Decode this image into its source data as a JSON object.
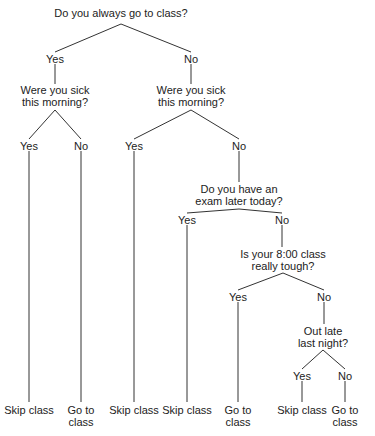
{
  "diagram": {
    "type": "decision-tree",
    "title": "Do you always go to class?",
    "nodes": [
      {
        "id": "q1",
        "text": "Do you always go to class?",
        "x": 121,
        "y": 7
      },
      {
        "id": "a1",
        "text": "Yes",
        "x": 55,
        "y": 53
      },
      {
        "id": "a2",
        "text": "No",
        "x": 191,
        "y": 53
      },
      {
        "id": "q2",
        "text": "Were you sick\nthis morning?",
        "x": 55,
        "y": 84
      },
      {
        "id": "q3",
        "text": "Were you sick\nthis morning?",
        "x": 191,
        "y": 84
      },
      {
        "id": "a3",
        "text": "Yes",
        "x": 29,
        "y": 140
      },
      {
        "id": "a4",
        "text": "No",
        "x": 81,
        "y": 140
      },
      {
        "id": "a5",
        "text": "Yes",
        "x": 134,
        "y": 140
      },
      {
        "id": "a6",
        "text": "No",
        "x": 239,
        "y": 140
      },
      {
        "id": "q4",
        "text": "Do you have an\nexam later today?",
        "x": 239,
        "y": 183
      },
      {
        "id": "a7",
        "text": "Yes",
        "x": 187,
        "y": 214
      },
      {
        "id": "a8",
        "text": "No",
        "x": 282,
        "y": 214
      },
      {
        "id": "q5",
        "text": "Is your 8:00 class\nreally tough?",
        "x": 283,
        "y": 248
      },
      {
        "id": "a9",
        "text": "Yes",
        "x": 238,
        "y": 291
      },
      {
        "id": "a10",
        "text": "No",
        "x": 324,
        "y": 291
      },
      {
        "id": "q6",
        "text": "Out late\nlast night?",
        "x": 323,
        "y": 325
      },
      {
        "id": "a11",
        "text": "Yes",
        "x": 302,
        "y": 370
      },
      {
        "id": "a12",
        "text": "No",
        "x": 345,
        "y": 370
      },
      {
        "id": "l1",
        "text": "Skip class",
        "x": 29,
        "y": 404
      },
      {
        "id": "l2",
        "text": "Go to\nclass",
        "x": 81,
        "y": 404
      },
      {
        "id": "l3",
        "text": "Skip class",
        "x": 134,
        "y": 404
      },
      {
        "id": "l4",
        "text": "Skip class",
        "x": 187,
        "y": 404
      },
      {
        "id": "l5",
        "text": "Go to\nclass",
        "x": 238,
        "y": 404
      },
      {
        "id": "l6",
        "text": "Skip class",
        "x": 302,
        "y": 404
      },
      {
        "id": "l7",
        "text": "Go to\nclass",
        "x": 345,
        "y": 404
      }
    ],
    "edges": [
      [
        121,
        24,
        55,
        52
      ],
      [
        121,
        24,
        191,
        52
      ],
      [
        55,
        64,
        55,
        84
      ],
      [
        191,
        64,
        191,
        84
      ],
      [
        55,
        110,
        29,
        139
      ],
      [
        55,
        110,
        81,
        139
      ],
      [
        191,
        110,
        134,
        139
      ],
      [
        191,
        110,
        239,
        139
      ],
      [
        29,
        151,
        29,
        402
      ],
      [
        81,
        151,
        81,
        402
      ],
      [
        134,
        151,
        134,
        402
      ],
      [
        239,
        151,
        239,
        182
      ],
      [
        239,
        209,
        187,
        213
      ],
      [
        239,
        209,
        282,
        213
      ],
      [
        187,
        225,
        187,
        402
      ],
      [
        282,
        225,
        282,
        247
      ],
      [
        283,
        273,
        238,
        290
      ],
      [
        283,
        273,
        324,
        290
      ],
      [
        238,
        302,
        238,
        402
      ],
      [
        324,
        302,
        324,
        324
      ],
      [
        323,
        350,
        302,
        369
      ],
      [
        323,
        350,
        345,
        369
      ],
      [
        302,
        381,
        302,
        402
      ],
      [
        345,
        381,
        345,
        402
      ]
    ]
  }
}
